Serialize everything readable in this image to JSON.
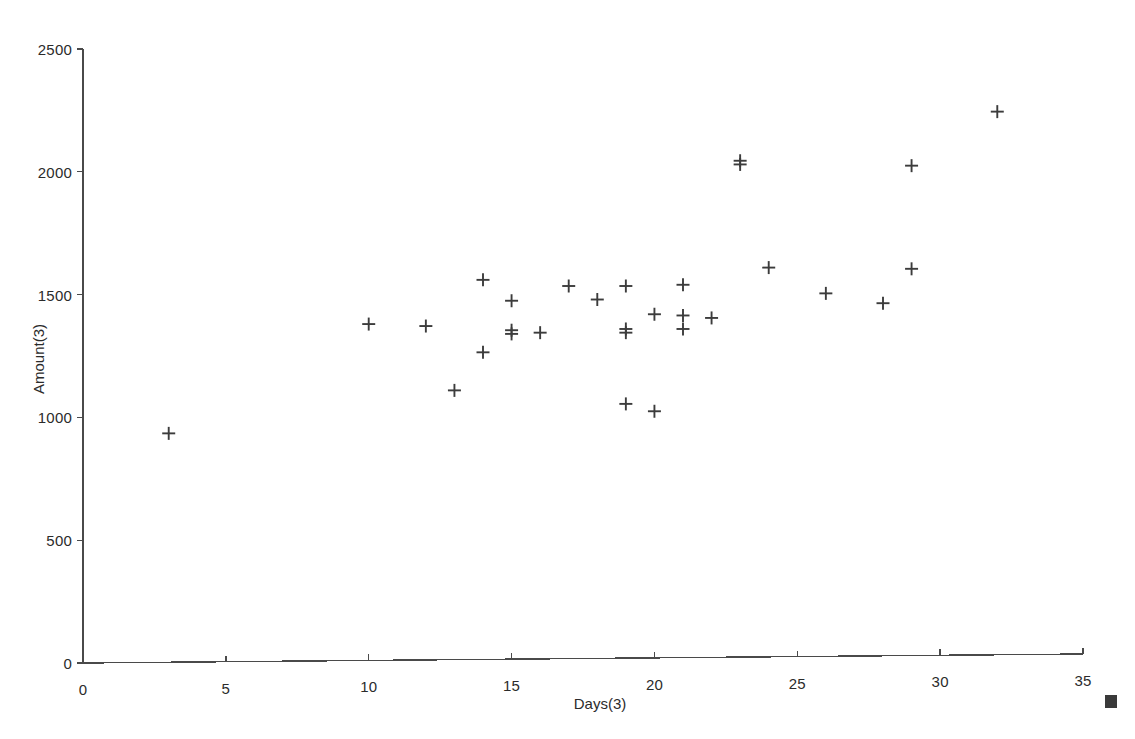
{
  "chart_data": {
    "type": "scatter",
    "title": "",
    "xlabel": "Days(3)",
    "ylabel": "Amount(3)",
    "xlim": [
      0,
      35
    ],
    "ylim": [
      0,
      2500
    ],
    "x_ticks": [
      0,
      5,
      10,
      15,
      20,
      25,
      30,
      35
    ],
    "x_tick_labels": [
      "0",
      "5",
      "10",
      "15",
      "20",
      "25",
      "30",
      "35"
    ],
    "y_ticks": [
      0,
      500,
      1000,
      1500,
      2000,
      2500
    ],
    "y_tick_labels": [
      "0",
      "500",
      "1000",
      "1500",
      "2000",
      "2500"
    ],
    "grid": false,
    "legend": false,
    "marker": "plus",
    "marker_color": "#3c3c3c",
    "axis_color": "#4a4a4a",
    "background": "#ffffff",
    "x": [
      3,
      10,
      12,
      13,
      14,
      14,
      15,
      15,
      15,
      16,
      17,
      18,
      19,
      19,
      19,
      19,
      20,
      20,
      21,
      21,
      21,
      22,
      23,
      23,
      24,
      26,
      28,
      29,
      29,
      32
    ],
    "y": [
      935,
      1380,
      1372,
      1110,
      1560,
      1265,
      1475,
      1355,
      1340,
      1345,
      1535,
      1480,
      1535,
      1360,
      1345,
      1055,
      1420,
      1025,
      1540,
      1415,
      1360,
      1405,
      2045,
      2030,
      1610,
      1505,
      1465,
      2025,
      1605,
      2245
    ],
    "points": [
      {
        "x": 3,
        "y": 935
      },
      {
        "x": 10,
        "y": 1380
      },
      {
        "x": 12,
        "y": 1372
      },
      {
        "x": 13,
        "y": 1110
      },
      {
        "x": 14,
        "y": 1560
      },
      {
        "x": 14,
        "y": 1265
      },
      {
        "x": 15,
        "y": 1475
      },
      {
        "x": 15,
        "y": 1355
      },
      {
        "x": 15,
        "y": 1340
      },
      {
        "x": 16,
        "y": 1345
      },
      {
        "x": 17,
        "y": 1535
      },
      {
        "x": 18,
        "y": 1480
      },
      {
        "x": 19,
        "y": 1535
      },
      {
        "x": 19,
        "y": 1360
      },
      {
        "x": 19,
        "y": 1345
      },
      {
        "x": 19,
        "y": 1055
      },
      {
        "x": 20,
        "y": 1420
      },
      {
        "x": 20,
        "y": 1025
      },
      {
        "x": 21,
        "y": 1540
      },
      {
        "x": 21,
        "y": 1415
      },
      {
        "x": 21,
        "y": 1360
      },
      {
        "x": 22,
        "y": 1405
      },
      {
        "x": 23,
        "y": 2045
      },
      {
        "x": 23,
        "y": 2030
      },
      {
        "x": 24,
        "y": 1610
      },
      {
        "x": 26,
        "y": 1505
      },
      {
        "x": 28,
        "y": 1465
      },
      {
        "x": 29,
        "y": 2025
      },
      {
        "x": 29,
        "y": 1605
      },
      {
        "x": 32,
        "y": 2245
      }
    ]
  },
  "annotations": {
    "corner_marker": "filled-square"
  }
}
